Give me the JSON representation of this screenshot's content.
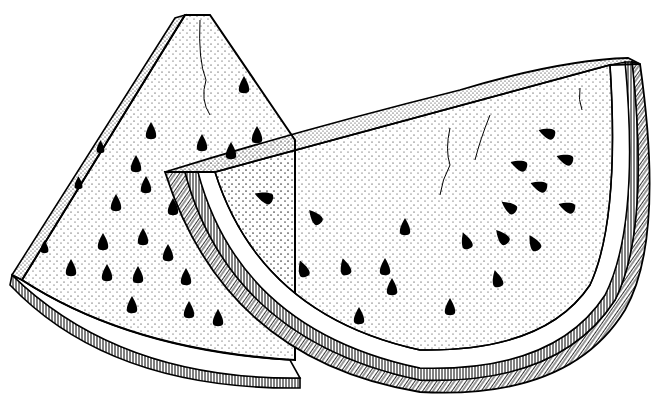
{
  "image": {
    "description": "Black and white pen-and-ink stippled illustration of two watermelon slices",
    "background": "#ffffff",
    "ink": "#000000",
    "subjects": [
      {
        "name": "back-slice",
        "shape": "upright triangular wedge",
        "seed_count_visible": 22
      },
      {
        "name": "front-slice",
        "shape": "half-moon wedge lying on side",
        "seed_count_visible": 22
      }
    ]
  }
}
